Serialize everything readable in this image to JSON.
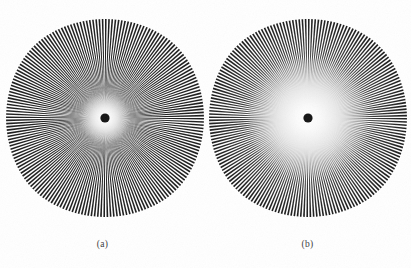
{
  "figure": {
    "background_color": "#ffffff",
    "width": 411,
    "height": 268,
    "ink_color": "#1c1c1c"
  },
  "panels": [
    {
      "id": "a",
      "caption": "(a)",
      "center_x": 105,
      "center_y": 118,
      "outer_radius": 97,
      "spoke_count": 192,
      "blur_radius": 16,
      "halo_radius": 26,
      "hub_radius": 4.6,
      "hub_color": "#141414",
      "description": "sharp radial star, small bright core halo"
    },
    {
      "id": "b",
      "caption": "(b)",
      "center_x": 308,
      "center_y": 118,
      "outer_radius": 97,
      "spoke_count": 192,
      "blur_radius": 46,
      "halo_radius": 62,
      "hub_radius": 4.6,
      "hub_color": "#141414",
      "description": "blurred radial star, large diffuse grey core"
    }
  ],
  "chart_data": {
    "type": "other",
    "subtitle": "",
    "xlabel": "",
    "ylabel": "",
    "annotations": [
      "(a)",
      "(b)"
    ],
    "series": [
      {
        "name": "(a)",
        "pattern": "siemens-star",
        "spokes": 192,
        "outer_radius_px": 97,
        "center": [
          105,
          118
        ],
        "blur_sigma_px": 16,
        "core_gray_radius_px": 26
      },
      {
        "name": "(b)",
        "pattern": "siemens-star",
        "spokes": 192,
        "outer_radius_px": 97,
        "center": [
          308,
          118
        ],
        "blur_sigma_px": 46,
        "core_gray_radius_px": 62
      }
    ],
    "legend_position": "below",
    "grid": false
  }
}
